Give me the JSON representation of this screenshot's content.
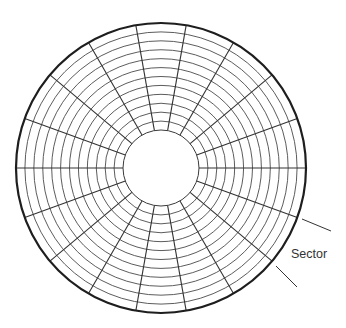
{
  "diagram": {
    "center": [
      161,
      168
    ],
    "outer_radius": 145,
    "inner_radius": 38,
    "track_count": 12,
    "sector_count": 18,
    "label": {
      "text": "Sector",
      "x": 291,
      "y": 258
    },
    "leaders": [
      {
        "x1": 302,
        "y1": 219,
        "x2": 331,
        "y2": 231
      },
      {
        "x1": 276,
        "y1": 266,
        "x2": 297,
        "y2": 287
      }
    ],
    "colors": {
      "rim": "#1e1e1e",
      "track": "#4a4a4a",
      "sector_line": "#333333",
      "background": "#ffffff"
    }
  }
}
